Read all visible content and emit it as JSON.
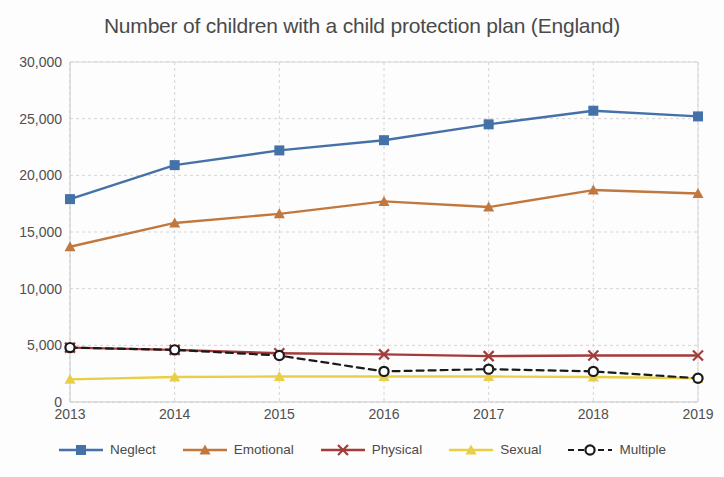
{
  "chart_data": {
    "type": "line",
    "title": "Number of children with a child protection plan (England)",
    "xlabel": "",
    "ylabel": "",
    "categories": [
      "2013",
      "2014",
      "2015",
      "2016",
      "2017",
      "2018",
      "2019"
    ],
    "x": [
      2013,
      2014,
      2015,
      2016,
      2017,
      2018,
      2019
    ],
    "ylim": [
      0,
      30000
    ],
    "ytick_labels": [
      "0",
      "5,000",
      "10,000",
      "15,000",
      "20,000",
      "25,000",
      "30,000"
    ],
    "ytick_values": [
      0,
      5000,
      10000,
      15000,
      20000,
      25000,
      30000
    ],
    "grid": true,
    "legend_position": "bottom",
    "series": [
      {
        "name": "Neglect",
        "color": "#4472a8",
        "marker": "square",
        "dash": "solid",
        "values": [
          17900,
          20900,
          22200,
          23100,
          24500,
          25700,
          25200
        ]
      },
      {
        "name": "Emotional",
        "color": "#c1783f",
        "marker": "triangle",
        "dash": "solid",
        "values": [
          13700,
          15800,
          16600,
          17700,
          17200,
          18700,
          18400
        ]
      },
      {
        "name": "Physical",
        "color": "#a33b3b",
        "marker": "x",
        "dash": "solid",
        "values": [
          4800,
          4600,
          4300,
          4200,
          4050,
          4100,
          4100
        ]
      },
      {
        "name": "Sexual",
        "color": "#e8cf47",
        "marker": "triangle",
        "dash": "solid",
        "values": [
          2000,
          2200,
          2250,
          2250,
          2250,
          2200,
          2100
        ]
      },
      {
        "name": "Multiple",
        "color": "#1a1a1a",
        "marker": "circle",
        "dash": "dashed",
        "values": [
          4800,
          4600,
          4100,
          2700,
          2900,
          2700,
          2100
        ]
      }
    ]
  },
  "legend": {
    "items": [
      {
        "label": "Neglect"
      },
      {
        "label": "Emotional"
      },
      {
        "label": "Physical"
      },
      {
        "label": "Sexual"
      },
      {
        "label": "Multiple"
      }
    ]
  }
}
